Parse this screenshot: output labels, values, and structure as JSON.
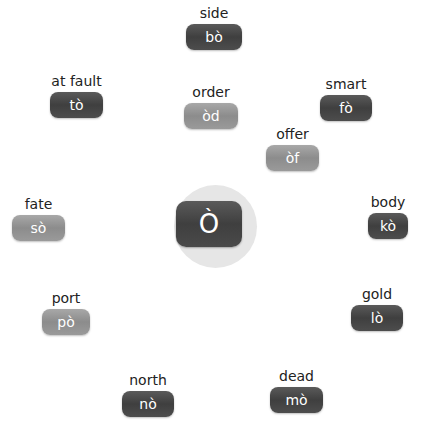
{
  "center": {
    "glyph": "Ò"
  },
  "nodes": [
    {
      "id": "side",
      "label": "side",
      "value": "bò",
      "tone": "dark"
    },
    {
      "id": "at-fault",
      "label": "at fault",
      "value": "tò",
      "tone": "dark"
    },
    {
      "id": "order",
      "label": "order",
      "value": "òd",
      "tone": "light"
    },
    {
      "id": "smart",
      "label": "smart",
      "value": "fò",
      "tone": "dark"
    },
    {
      "id": "offer",
      "label": "offer",
      "value": "òf",
      "tone": "light"
    },
    {
      "id": "fate",
      "label": "fate",
      "value": "sò",
      "tone": "light"
    },
    {
      "id": "body",
      "label": "body",
      "value": "kò",
      "tone": "dark"
    },
    {
      "id": "port",
      "label": "port",
      "value": "pò",
      "tone": "light"
    },
    {
      "id": "gold",
      "label": "gold",
      "value": "lò",
      "tone": "dark"
    },
    {
      "id": "north",
      "label": "north",
      "value": "nò",
      "tone": "dark"
    },
    {
      "id": "dead",
      "label": "dead",
      "value": "mò",
      "tone": "dark"
    }
  ]
}
